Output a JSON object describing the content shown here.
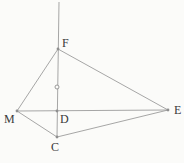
{
  "diagram": {
    "canvas": {
      "width": 184,
      "height": 163,
      "background": "#fbfbf9"
    },
    "style": {
      "line_color": "#9c9c9c",
      "vertex_dot_color": "#8f8f8f",
      "label_color": "#3a3a3a",
      "line_width": 0.9,
      "label_font_size": 12,
      "vertex_dot_radius": 1.4
    },
    "points": [
      {
        "id": "F",
        "x": 58,
        "y": 49,
        "label": "F",
        "label_x": 62,
        "label_y": 47
      },
      {
        "id": "M",
        "x": 17,
        "y": 111,
        "label": "M",
        "label_x": 4,
        "label_y": 123
      },
      {
        "id": "D",
        "x": 57,
        "y": 111,
        "label": "D",
        "label_x": 60,
        "label_y": 123
      },
      {
        "id": "C",
        "x": 57,
        "y": 137,
        "label": "C",
        "label_x": 51,
        "label_y": 151
      },
      {
        "id": "E",
        "x": 168,
        "y": 110,
        "label": "E",
        "label_x": 174,
        "label_y": 114
      }
    ],
    "segments": [
      {
        "from": "F",
        "to": "M"
      },
      {
        "from": "F",
        "to": "E"
      },
      {
        "from": "M",
        "to": "E"
      },
      {
        "from": "M",
        "to": "C"
      },
      {
        "from": "C",
        "to": "E"
      }
    ],
    "vertical_line": {
      "x1": 59,
      "y1": 2,
      "x2": 57,
      "y2": 137
    },
    "extra_marker": {
      "x": 57,
      "y": 87,
      "radius": 2
    }
  }
}
